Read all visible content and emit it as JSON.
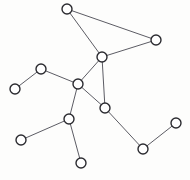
{
  "figure": {
    "background_color": "#fdfdfc",
    "width": 190,
    "height": 180
  },
  "style": {
    "node_fill": "#ffffff",
    "node_stroke": "#2b2b30",
    "node_stroke_width": 1.4,
    "node_radius": 5,
    "edge_stroke": "#4a4a52",
    "edge_stroke_width": 0.9
  },
  "graph_data": {
    "type": "node-link-diagram",
    "directed": false,
    "node_count": 12,
    "edge_count": 13,
    "nodes": [
      {
        "id": "n1",
        "label": "",
        "x": 67,
        "y": 9,
        "degree": 2
      },
      {
        "id": "n2",
        "label": "",
        "x": 156,
        "y": 40,
        "degree": 2
      },
      {
        "id": "n3",
        "label": "",
        "x": 102,
        "y": 57,
        "degree": 4
      },
      {
        "id": "n4",
        "label": "",
        "x": 41,
        "y": 69,
        "degree": 2
      },
      {
        "id": "n5",
        "label": "",
        "x": 78,
        "y": 84,
        "degree": 4
      },
      {
        "id": "n6",
        "label": "",
        "x": 15,
        "y": 89,
        "degree": 1
      },
      {
        "id": "n7",
        "label": "",
        "x": 105,
        "y": 108,
        "degree": 3
      },
      {
        "id": "n8",
        "label": "",
        "x": 69,
        "y": 119,
        "degree": 3
      },
      {
        "id": "n9",
        "label": "",
        "x": 21,
        "y": 140,
        "degree": 1
      },
      {
        "id": "n10",
        "label": "",
        "x": 81,
        "y": 163,
        "degree": 1
      },
      {
        "id": "n11",
        "label": "",
        "x": 143,
        "y": 149,
        "degree": 2
      },
      {
        "id": "n12",
        "label": "",
        "x": 176,
        "y": 123,
        "degree": 1
      }
    ],
    "edges": [
      {
        "source": "n1",
        "target": "n2"
      },
      {
        "source": "n1",
        "target": "n3"
      },
      {
        "source": "n2",
        "target": "n3"
      },
      {
        "source": "n3",
        "target": "n5"
      },
      {
        "source": "n3",
        "target": "n7"
      },
      {
        "source": "n4",
        "target": "n5"
      },
      {
        "source": "n4",
        "target": "n6"
      },
      {
        "source": "n5",
        "target": "n7"
      },
      {
        "source": "n5",
        "target": "n8"
      },
      {
        "source": "n8",
        "target": "n9"
      },
      {
        "source": "n8",
        "target": "n10"
      },
      {
        "source": "n7",
        "target": "n11"
      },
      {
        "source": "n11",
        "target": "n12"
      }
    ]
  }
}
